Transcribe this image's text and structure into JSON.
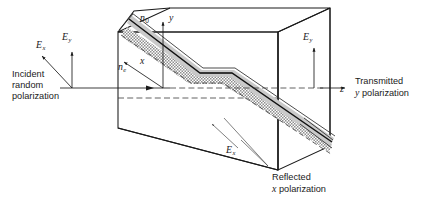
{
  "figure": {
    "colors": {
      "line": "#1a1a1a",
      "cement_fill": "#c9c9c9",
      "hatch": "#9a9a9a",
      "background": "#ffffff",
      "dashed": "#3a3a3a"
    }
  },
  "labels": {
    "incident": {
      "line1": "Incident",
      "line2": "random",
      "line3": "polarization"
    },
    "transmitted": {
      "line1": "Transmitted",
      "line2_italic": "y",
      "line2_rest": " polarization"
    },
    "reflected": {
      "line1": "Reflected",
      "line2_italic": "x",
      "line2_rest": " polarization"
    },
    "field_ex_left": {
      "symbol": "E",
      "subscript": "x"
    },
    "field_ey_left": {
      "symbol": "E",
      "subscript": "y"
    },
    "field_ey_right": {
      "symbol": "E",
      "subscript": "y"
    },
    "field_ex_bottom": {
      "symbol": "E",
      "subscript": "x"
    },
    "index_ordinary": {
      "symbol": "n",
      "subscript": "0"
    },
    "index_extraordinary": {
      "symbol": "n",
      "subscript": "e"
    },
    "axis_x": "x",
    "axis_y": "y",
    "axis_z": "z"
  }
}
